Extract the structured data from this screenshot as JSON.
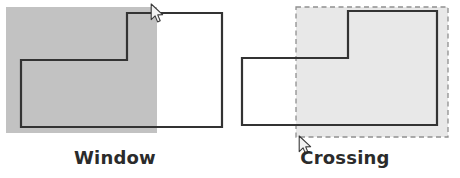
{
  "figure": {
    "background_color": "#ffffff",
    "width": 460,
    "height": 178
  },
  "style": {
    "shape_outline_color": "#333333",
    "shape_outline_width": 2.2,
    "shape_fill_color": "#ffffff",
    "window_selection_fill": "#c2c2c2",
    "window_selection_border": "none",
    "crossing_selection_fill": "#e8e8e8",
    "crossing_selection_border_color": "#909090",
    "crossing_selection_border_style": "dashed",
    "label_color": "#2b2b2b",
    "cursor_fill": "#f2f2f2",
    "cursor_stroke": "#3a3a3a"
  },
  "panels": [
    {
      "id": "window",
      "label": "Window",
      "selection_type": "window",
      "selection_border_style": "solid",
      "selection_fill": "#c2c2c2",
      "selection_rect": {
        "x": 6,
        "y": 7,
        "width": 151,
        "height": 126
      },
      "shape_name": "l-shaped-polygon",
      "shape_points": "21,60 127,60 127,13 222,13 222,127 21,127",
      "cursor": {
        "x": 150,
        "y": 3,
        "icon": "arrow-pointer-icon"
      }
    },
    {
      "id": "crossing",
      "label": "Crossing",
      "selection_type": "crossing",
      "selection_border_style": "dashed",
      "selection_fill": "#e8e8e8",
      "selection_rect": {
        "x": 66,
        "y": 7,
        "width": 152,
        "height": 130
      },
      "shape_name": "l-shaped-polygon",
      "shape_points": "12,58 118,58 118,11 207,11 207,125 12,125",
      "cursor": {
        "x": 68,
        "y": 135,
        "icon": "arrow-pointer-icon"
      }
    }
  ]
}
